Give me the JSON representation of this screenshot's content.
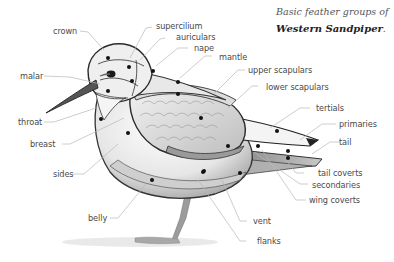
{
  "title": {
    "line1": "Basic feather groups of",
    "species": "Western Sandpiper",
    "period": "."
  },
  "labels": {
    "crown": "crown",
    "supercilium": "supercilium",
    "auriculars": "auriculars",
    "nape": "nape",
    "mantle": "mantle",
    "upper_scapulars": "upper scapulars",
    "lower_scapulars": "lower scapulars",
    "tertials": "tertials",
    "primaries": "primaries",
    "tail": "tail",
    "tail_coverts": "tail coverts",
    "secondaries": "secondaries",
    "wing_coverts": "wing coverts",
    "vent": "vent",
    "flanks": "flanks",
    "belly": "belly",
    "sides": "sides",
    "breast": "breast",
    "throat": "throat",
    "malar": "malar"
  }
}
